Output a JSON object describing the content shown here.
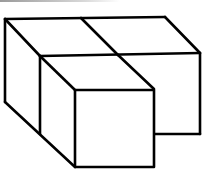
{
  "figure": {
    "stroke_color": "#000000",
    "background_color": "#ffffff",
    "cube_count": 3
  },
  "diagram_data": {
    "type": "isometric-solid",
    "cubes": [
      {
        "name": "back-left-cube"
      },
      {
        "name": "back-right-cube"
      },
      {
        "name": "front-cube"
      }
    ]
  }
}
